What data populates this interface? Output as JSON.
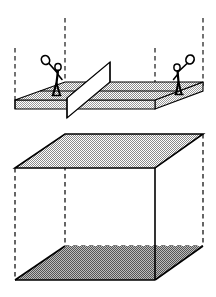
{
  "figure": {
    "width": 216,
    "height": 297,
    "background_color": "#ffffff",
    "stroke_color": "#000000",
    "shade_light_color": "#cccccc",
    "shade_dark_color": "#b4b4b4",
    "net_fill_color": "#ffffff",
    "caption": ""
  },
  "court": {
    "label": "tennis-court-slab",
    "top_face": {
      "label": "court-playing-surface",
      "points": "15,100 65,82 203,82 155,100",
      "fill": "#cccccc"
    },
    "front_face": {
      "label": "court-front-edge",
      "points": "15,100 155,100 155,109 15,109",
      "fill": "#cccccc"
    },
    "right_face": {
      "label": "court-right-edge",
      "points": "155,100 203,82 203,91 155,109",
      "fill": "#cccccc"
    },
    "service_line": {
      "label": "court-service-line",
      "from": "42,91",
      "to": "180,91"
    }
  },
  "net": {
    "label": "tennis-net",
    "panel": "67,98 110,62 110,82 67,118",
    "fill": "#ffffff",
    "post_left": "67,98 67,118",
    "post_right": "110,62 110,82"
  },
  "players": [
    {
      "id": "player-left",
      "label": "Left player with racket",
      "head": {
        "cx": 58,
        "cy": 67,
        "r": 3.0
      },
      "body": "58,70 56,84 53,95",
      "leg_back": "56,84 60,95",
      "arm_up": "57,73 48,63",
      "arm_down": "57,74 62,80",
      "racket": {
        "cx": 45,
        "cy": 60,
        "rx": 4.2,
        "ry": 4.6,
        "angle": -30
      }
    },
    {
      "id": "player-right",
      "label": "Right player with racket",
      "head": {
        "cx": 177,
        "cy": 67,
        "r": 3.0
      },
      "body": "177,70 178,82 176,94",
      "leg_back": "178,82 181,94",
      "arm_up": "178,72 186,64",
      "arm_down": "178,74 174,80",
      "racket": {
        "cx": 190,
        "cy": 59,
        "rx": 4.2,
        "ry": 4.6,
        "angle": 28
      }
    }
  ],
  "box": {
    "label": "bounding-volume-box",
    "top_face": {
      "label": "box-top-face",
      "points": "15,168 65,134 203,134 155,168",
      "fill": "#cccccc"
    },
    "bottom_face": {
      "label": "box-bottom-face",
      "points": "15,280 65,246 203,246 155,280",
      "fill": "#b4b4b4"
    },
    "solid_edges": [
      {
        "label": "box-top-back-left",
        "from": "15,168",
        "to": "65,134"
      },
      {
        "label": "box-top-back",
        "from": "65,134",
        "to": "203,134"
      },
      {
        "label": "box-top-right",
        "from": "203,134",
        "to": "155,168"
      },
      {
        "label": "box-top-front",
        "from": "155,168",
        "to": "15,168"
      },
      {
        "label": "box-bottom-back-left",
        "from": "15,280",
        "to": "65,246"
      },
      {
        "label": "box-bottom-right",
        "from": "203,246",
        "to": "155,280"
      },
      {
        "label": "box-bottom-front",
        "from": "155,280",
        "to": "15,280"
      },
      {
        "label": "box-vertical-front-left",
        "from": "15,168",
        "to": "15,280"
      },
      {
        "label": "box-vertical-front-right",
        "from": "155,168",
        "to": "155,280"
      }
    ],
    "dashed_edges": [
      {
        "label": "box-vertical-back-left",
        "from": "65,134",
        "to": "65,246"
      },
      {
        "label": "box-vertical-back-right",
        "from": "203,134",
        "to": "203,246"
      },
      {
        "label": "box-bottom-back-hidden",
        "from": "65,246",
        "to": "203,246"
      }
    ]
  },
  "projection_lines": [
    {
      "label": "projector-front-left",
      "x": 15,
      "y1": 48,
      "y2": 104
    },
    {
      "label": "projector-back-left",
      "x": 65,
      "y1": 18,
      "y2": 86
    },
    {
      "label": "projector-front-right",
      "x": 155,
      "y1": 48,
      "y2": 104
    },
    {
      "label": "projector-back-right",
      "x": 203,
      "y1": 18,
      "y2": 86
    }
  ]
}
